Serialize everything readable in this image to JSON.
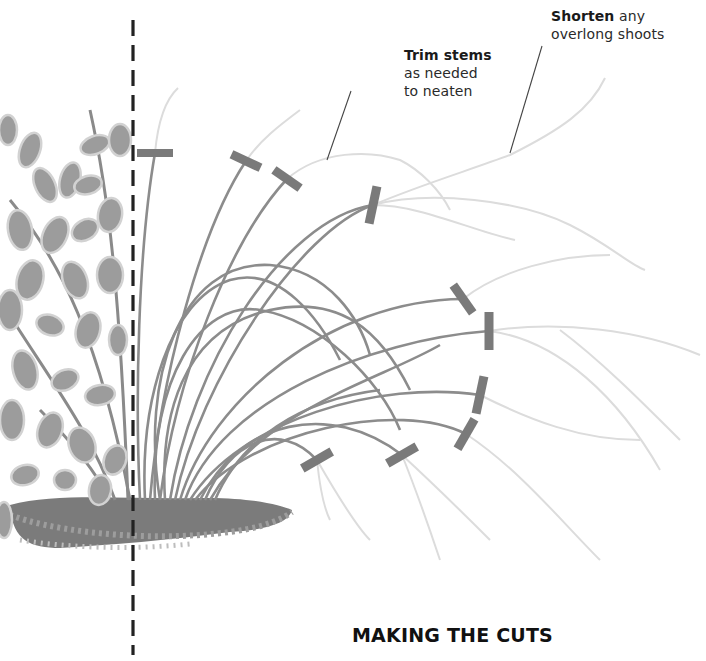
{
  "illustration": {
    "title": "MAKING THE CUTS",
    "subject": "Ornamental grass clump beside leafy shrub, with cut positions marked",
    "colors": {
      "stem_dark": "#8a8a8a",
      "stem_faded": "#dcdcdc",
      "cut_marker": "#7a7a7a",
      "divider": "#222222",
      "soil": "#7b7b7b",
      "leaf": "#9a9a9a",
      "leaf_edge": "#c8c8c8"
    }
  },
  "annotations": [
    {
      "id": "trim",
      "bold": "Trim stems",
      "text_lines": [
        "as needed",
        "to neaten"
      ]
    },
    {
      "id": "shorten",
      "bold": "Shorten",
      "after_bold": " any",
      "text_lines": [
        "overlong shoots"
      ]
    }
  ],
  "cut_markers": [
    {
      "x": 155,
      "y": 153,
      "angle": 0
    },
    {
      "x": 246,
      "y": 161,
      "angle": 25
    },
    {
      "x": 287,
      "y": 179,
      "angle": 35
    },
    {
      "x": 373,
      "y": 205,
      "angle": -78
    },
    {
      "x": 463,
      "y": 299,
      "angle": 55
    },
    {
      "x": 489,
      "y": 331,
      "angle": 90
    },
    {
      "x": 480,
      "y": 395,
      "angle": 102
    },
    {
      "x": 466,
      "y": 434,
      "angle": 120
    },
    {
      "x": 402,
      "y": 455,
      "angle": -30
    },
    {
      "x": 317,
      "y": 460,
      "angle": -30
    }
  ]
}
